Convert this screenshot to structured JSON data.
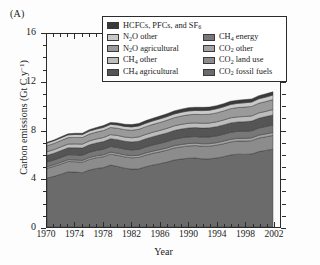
{
  "panel": {
    "label": "(A)"
  },
  "chart_data": {
    "type": "area",
    "stacked": true,
    "title": "",
    "xlabel": "Year",
    "ylabel": "Carbon emissions (Gt C y⁻¹)",
    "xlim": [
      1970,
      2003
    ],
    "ylim": [
      0,
      16
    ],
    "yticks": [
      0,
      4,
      8,
      12,
      16
    ],
    "ytick_labels": [
      "0",
      "4",
      "8",
      "12",
      "16"
    ],
    "yminor_step": 1,
    "xticks": [
      1970,
      1974,
      1978,
      1982,
      1986,
      1990,
      1994,
      1998,
      2002
    ],
    "xtick_labels": [
      "1970",
      "1974",
      "1978",
      "1982",
      "1986",
      "1990",
      "1994",
      "1998",
      "2002"
    ],
    "xminor_step": 1,
    "grid": false,
    "legend_position": "upper-center",
    "x": [
      1970,
      1971,
      1972,
      1973,
      1974,
      1975,
      1976,
      1977,
      1978,
      1979,
      1980,
      1981,
      1982,
      1983,
      1984,
      1985,
      1986,
      1987,
      1988,
      1989,
      1990,
      1991,
      1992,
      1993,
      1994,
      1995,
      1996,
      1997,
      1998,
      1999,
      2000,
      2001,
      2002
    ],
    "series": [
      {
        "name": "CO₂ fossil fuels",
        "key": "co2_fossil_fuels",
        "color": "#6b6b6b",
        "values": [
          4.05,
          4.2,
          4.38,
          4.58,
          4.55,
          4.5,
          4.72,
          4.85,
          4.93,
          5.13,
          5.02,
          4.88,
          4.8,
          4.82,
          5.0,
          5.14,
          5.25,
          5.38,
          5.55,
          5.63,
          5.7,
          5.72,
          5.65,
          5.65,
          5.72,
          5.83,
          5.97,
          6.04,
          6.02,
          6.05,
          6.25,
          6.35,
          6.45
        ],
        "stack_order": 1
      },
      {
        "name": "CO₂ land use",
        "key": "co2_land_use",
        "color": "#8c8c8c",
        "values": [
          0.82,
          0.83,
          0.84,
          0.85,
          0.86,
          0.87,
          0.88,
          0.89,
          0.9,
          0.91,
          0.92,
          0.93,
          0.94,
          0.95,
          0.96,
          0.97,
          0.98,
          0.99,
          1.0,
          1.01,
          1.02,
          1.03,
          1.04,
          1.05,
          1.06,
          1.07,
          1.08,
          1.09,
          1.1,
          1.11,
          1.12,
          1.13,
          1.14
        ],
        "stack_order": 2
      },
      {
        "name": "CO₂ other",
        "key": "co2_other",
        "color": "#a3a3a3",
        "values": [
          0.14,
          0.14,
          0.15,
          0.15,
          0.15,
          0.15,
          0.16,
          0.16,
          0.16,
          0.17,
          0.17,
          0.17,
          0.17,
          0.18,
          0.18,
          0.18,
          0.19,
          0.19,
          0.19,
          0.2,
          0.2,
          0.2,
          0.21,
          0.21,
          0.21,
          0.22,
          0.22,
          0.22,
          0.23,
          0.23,
          0.24,
          0.24,
          0.25
        ],
        "stack_order": 3
      },
      {
        "name": "CH₄ energy",
        "key": "ch4_energy",
        "color": "#777777",
        "values": [
          0.38,
          0.39,
          0.4,
          0.41,
          0.42,
          0.43,
          0.44,
          0.45,
          0.46,
          0.47,
          0.48,
          0.48,
          0.48,
          0.49,
          0.5,
          0.51,
          0.52,
          0.53,
          0.54,
          0.55,
          0.55,
          0.55,
          0.55,
          0.56,
          0.56,
          0.57,
          0.58,
          0.58,
          0.59,
          0.59,
          0.6,
          0.61,
          0.62
        ],
        "stack_order": 4
      },
      {
        "name": "CH₄ agricultural",
        "key": "ch4_agricultural",
        "color": "#555555",
        "values": [
          0.55,
          0.56,
          0.57,
          0.58,
          0.59,
          0.6,
          0.61,
          0.62,
          0.63,
          0.64,
          0.65,
          0.65,
          0.66,
          0.67,
          0.68,
          0.69,
          0.7,
          0.71,
          0.72,
          0.73,
          0.74,
          0.74,
          0.75,
          0.75,
          0.76,
          0.77,
          0.78,
          0.78,
          0.79,
          0.8,
          0.81,
          0.82,
          0.83
        ],
        "stack_order": 5
      },
      {
        "name": "CH₄ other",
        "key": "ch4_other",
        "color": "#bdbdbd",
        "values": [
          0.3,
          0.3,
          0.31,
          0.31,
          0.32,
          0.32,
          0.33,
          0.33,
          0.34,
          0.34,
          0.35,
          0.35,
          0.35,
          0.36,
          0.36,
          0.37,
          0.37,
          0.38,
          0.38,
          0.39,
          0.39,
          0.39,
          0.4,
          0.4,
          0.41,
          0.41,
          0.42,
          0.42,
          0.43,
          0.43,
          0.44,
          0.44,
          0.45
        ],
        "stack_order": 6
      },
      {
        "name": "N₂O agricultural",
        "key": "n2o_agricultural",
        "color": "#9a9a9a",
        "values": [
          0.5,
          0.51,
          0.52,
          0.53,
          0.54,
          0.55,
          0.56,
          0.57,
          0.58,
          0.59,
          0.6,
          0.61,
          0.62,
          0.63,
          0.64,
          0.65,
          0.66,
          0.67,
          0.68,
          0.69,
          0.7,
          0.71,
          0.72,
          0.73,
          0.74,
          0.75,
          0.76,
          0.77,
          0.78,
          0.79,
          0.8,
          0.81,
          0.82
        ],
        "stack_order": 7
      },
      {
        "name": "N₂O other",
        "key": "n2o_other",
        "color": "#c9c9c9",
        "values": [
          0.22,
          0.22,
          0.23,
          0.23,
          0.24,
          0.24,
          0.25,
          0.25,
          0.26,
          0.26,
          0.27,
          0.27,
          0.28,
          0.28,
          0.29,
          0.29,
          0.3,
          0.3,
          0.31,
          0.31,
          0.32,
          0.32,
          0.33,
          0.33,
          0.34,
          0.34,
          0.35,
          0.35,
          0.36,
          0.36,
          0.37,
          0.37,
          0.38
        ],
        "stack_order": 8
      },
      {
        "name": "HCFCs, PFCs, and SF₆",
        "key": "hcfcs_pfcs_sf6",
        "color": "#3a3a3a",
        "values": [
          0.06,
          0.07,
          0.08,
          0.09,
          0.1,
          0.11,
          0.12,
          0.13,
          0.15,
          0.16,
          0.17,
          0.18,
          0.19,
          0.2,
          0.21,
          0.22,
          0.23,
          0.24,
          0.25,
          0.26,
          0.27,
          0.27,
          0.27,
          0.26,
          0.26,
          0.26,
          0.26,
          0.26,
          0.26,
          0.26,
          0.26,
          0.27,
          0.27
        ],
        "stack_order": 9
      }
    ]
  },
  "legend": {
    "entries": [
      {
        "label_html": "HCFCs, PFCs, and SF<sub>6</sub>",
        "color": "#3a3a3a",
        "key": "hcfcs_pfcs_sf6",
        "column": 1,
        "span": 2
      },
      {
        "label_html": "N<sub>2</sub>O other",
        "color": "#c9c9c9",
        "key": "n2o_other",
        "column": 1
      },
      {
        "label_html": "N<sub>2</sub>O agricultural",
        "color": "#9a9a9a",
        "key": "n2o_agricultural",
        "column": 1
      },
      {
        "label_html": "CH<sub>4</sub> other",
        "color": "#bdbdbd",
        "key": "ch4_other",
        "column": 1
      },
      {
        "label_html": "CH<sub>4</sub> agricultural",
        "color": "#555555",
        "key": "ch4_agricultural",
        "column": 1
      },
      {
        "label_html": "CH<sub>4</sub> energy",
        "color": "#777777",
        "key": "ch4_energy",
        "column": 2
      },
      {
        "label_html": "CO<sub>2</sub> other",
        "color": "#a3a3a3",
        "key": "co2_other",
        "column": 2
      },
      {
        "label_html": "CO<sub>2</sub> land use",
        "color": "#8c8c8c",
        "key": "co2_land_use",
        "column": 2
      },
      {
        "label_html": "CO<sub>2</sub> fossil fuels",
        "color": "#6b6b6b",
        "key": "co2_fossil_fuels",
        "column": 2
      }
    ]
  },
  "axes": {
    "frame_color": "#2b2b2b",
    "plot_background": "#fbfbfb"
  }
}
